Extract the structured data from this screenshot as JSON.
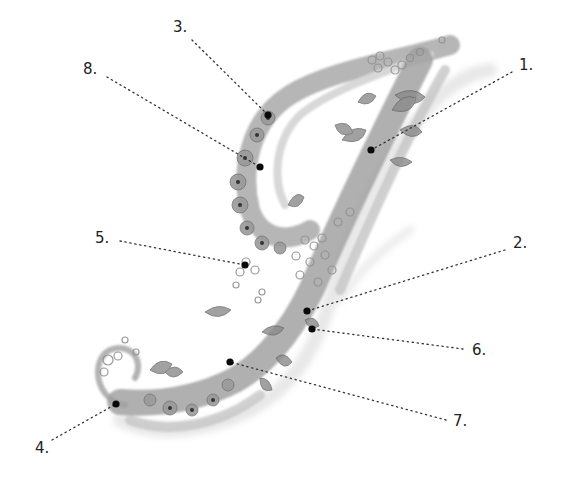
{
  "figure": {
    "callouts": [
      {
        "label": "1.",
        "label_x": 519,
        "label_y": 58,
        "line_start": [
          512,
          72
        ],
        "dot": [
          371,
          150
        ]
      },
      {
        "label": "2.",
        "label_x": 513,
        "label_y": 236,
        "line_start": [
          505,
          250
        ],
        "dot": [
          307,
          311
        ]
      },
      {
        "label": "3.",
        "label_x": 173,
        "label_y": 20,
        "line_start": [
          192,
          40
        ],
        "dot": [
          268,
          115
        ]
      },
      {
        "label": "4.",
        "label_x": 35,
        "label_y": 441,
        "line_start": [
          52,
          440
        ],
        "dot": [
          116,
          404
        ]
      },
      {
        "label": "5.",
        "label_x": 95,
        "label_y": 231,
        "line_start": [
          120,
          241
        ],
        "dot": [
          245,
          265
        ]
      },
      {
        "label": "6.",
        "label_x": 472,
        "label_y": 343,
        "line_start": [
          463,
          349
        ],
        "dot": [
          312,
          329
        ]
      },
      {
        "label": "7.",
        "label_x": 453,
        "label_y": 414,
        "line_start": [
          446,
          420
        ],
        "dot": [
          230,
          362
        ]
      },
      {
        "label": "8.",
        "label_x": 83,
        "label_y": 62,
        "line_start": [
          107,
          77
        ],
        "dot": [
          260,
          167
        ]
      }
    ]
  }
}
